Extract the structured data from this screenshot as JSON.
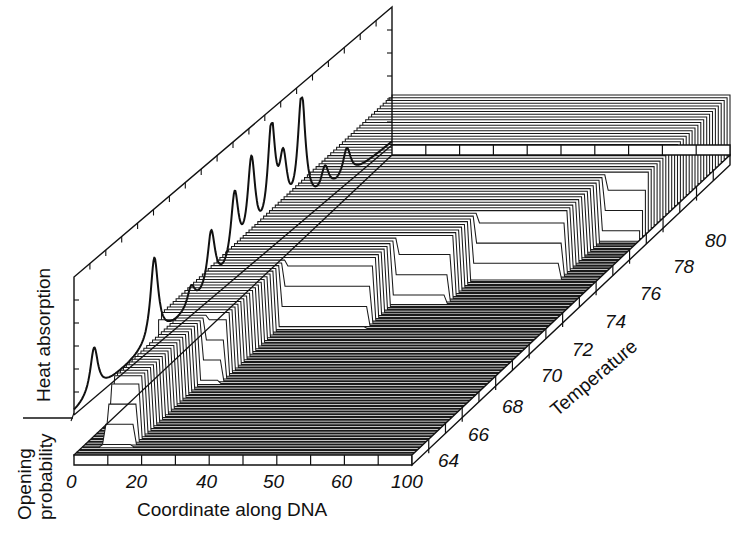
{
  "chart_data": {
    "type": "waterfall-3d",
    "title": "",
    "panels": {
      "front": {
        "name": "Opening probability",
        "xlabel": "Coordinate along DNA",
        "ylabel": "Opening probability",
        "x_ticks": [
          "0",
          "20",
          "40",
          "50",
          "60",
          "100"
        ],
        "x_range": [
          0,
          100
        ]
      },
      "back": {
        "name": "Heat absorption",
        "ylabel": "Heat absorption",
        "xlabel": "Temperature",
        "description": "Differential melting curve (heat absorption vs temperature) projected on the back wall",
        "x_range": [
          63,
          82
        ],
        "peaks": [
          {
            "temperature": 64.2,
            "height": 0.4
          },
          {
            "temperature": 67.8,
            "height": 0.72
          },
          {
            "temperature": 70.0,
            "height": 0.18
          },
          {
            "temperature": 71.2,
            "height": 0.5
          },
          {
            "temperature": 72.6,
            "height": 0.62
          },
          {
            "temperature": 73.6,
            "height": 0.78
          },
          {
            "temperature": 74.8,
            "height": 0.92
          },
          {
            "temperature": 75.5,
            "height": 0.52
          },
          {
            "temperature": 76.6,
            "height": 1.0
          },
          {
            "temperature": 78.0,
            "height": 0.22
          },
          {
            "temperature": 79.3,
            "height": 0.25
          }
        ]
      }
    },
    "z_axis": {
      "label": "Temperature",
      "ticks": [
        "64",
        "66",
        "68",
        "70",
        "72",
        "74",
        "76",
        "78",
        "80"
      ],
      "range": [
        63,
        82
      ]
    },
    "series_description": "Stacked opening-probability profiles (0 to 1) along DNA coordinate, one trace per temperature step from ~63 to ~82; melted (open) regions grow with temperature",
    "melted_regions_by_temperature": [
      {
        "t_start": 63.5,
        "x_start": 6,
        "x_end": 14
      },
      {
        "t_start": 67.5,
        "x_start": 0,
        "x_end": 20
      },
      {
        "t_start": 71.0,
        "x_start": 20,
        "x_end": 46
      },
      {
        "t_start": 72.5,
        "x_start": 46,
        "x_end": 62
      },
      {
        "t_start": 74.0,
        "x_start": 62,
        "x_end": 88
      },
      {
        "t_start": 76.5,
        "x_start": 88,
        "x_end": 100
      }
    ],
    "grid": false,
    "legend": null
  },
  "labels": {
    "heat_absorption": "Heat absorption",
    "opening_line1": "Opening",
    "opening_line2": "probability",
    "x_title": "Coordinate along DNA",
    "z_title": "Temperature"
  }
}
